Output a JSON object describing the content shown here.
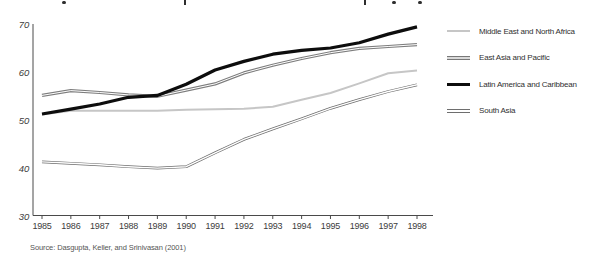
{
  "chart_data": {
    "type": "line",
    "title": "",
    "xlabel": "",
    "ylabel": "",
    "x": [
      1985,
      1986,
      1987,
      1988,
      1989,
      1990,
      1991,
      1992,
      1993,
      1994,
      1995,
      1996,
      1997,
      1998
    ],
    "series": [
      {
        "name": "Middle East and North Africa",
        "style": "light-solid",
        "color": "#c6c6c6",
        "values": [
          51.2,
          52.0,
          52.0,
          52.0,
          52.0,
          52.2,
          52.3,
          52.4,
          52.8,
          54.3,
          55.7,
          57.7,
          59.8,
          60.4
        ]
      },
      {
        "name": "East Asia and Pacific",
        "style": "gray-double",
        "color": "#7d7d7d",
        "values": [
          55.2,
          56.2,
          55.8,
          55.3,
          55.0,
          56.3,
          57.6,
          59.9,
          61.5,
          62.9,
          64.1,
          65.0,
          65.4,
          65.8
        ]
      },
      {
        "name": "Latin America and Caribbean",
        "style": "black-solid",
        "color": "#0d0d0d",
        "values": [
          51.3,
          52.3,
          53.4,
          54.8,
          55.2,
          57.5,
          60.5,
          62.3,
          63.8,
          64.6,
          65.1,
          66.2,
          68.0,
          69.5
        ]
      },
      {
        "name": "South Asia",
        "style": "outline-double",
        "color": "#6e6e6e",
        "values": [
          41.3,
          41.0,
          40.7,
          40.3,
          40.0,
          40.3,
          43.2,
          46.0,
          48.2,
          50.3,
          52.5,
          54.3,
          56.0,
          57.4
        ]
      }
    ],
    "ylim": [
      30,
      70
    ],
    "yticks": [
      30,
      40,
      50,
      60,
      70
    ],
    "grid": false,
    "legend_position": "right"
  },
  "source_note": "Source: Dasgupta, Keller, and Srinivasan (2001)"
}
